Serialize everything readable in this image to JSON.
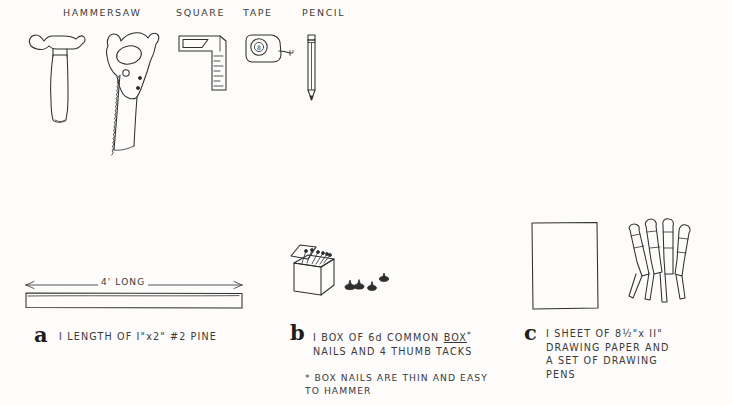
{
  "tools_row": {
    "labels": [
      {
        "name": "hammer",
        "text": "HAMMER"
      },
      {
        "name": "saw",
        "text": "SAW"
      },
      {
        "name": "square",
        "text": "SQUARE"
      },
      {
        "name": "tape",
        "text": "TAPE"
      },
      {
        "name": "pencil",
        "text": "PENCIL"
      }
    ],
    "tape_reel_mark": "8"
  },
  "materials": {
    "a": {
      "letter": "a",
      "dimension": "4' LONG",
      "caption_line1": "I LENGTH OF I\"x2\"  #2 PINE",
      "caption_prefix": "I LENGTH OF I\"x2\" ",
      "caption_grade": "#2 PINE"
    },
    "b": {
      "letter": "b",
      "caption_line1_pre": "I BOX OF 6d COMMON ",
      "caption_line1_underlined": "BOX",
      "caption_line1_star": "*",
      "caption_line2": "NAILS AND 4 THUMB TACKS"
    },
    "c": {
      "letter": "c",
      "caption_line1": "I SHEET OF 8½\"x II\"",
      "caption_line2": "DRAWING PAPER AND",
      "caption_line3": "A  SET OF DRAWING",
      "caption_line4": "PENS"
    }
  },
  "footnote": {
    "line1": "* BOX NAILS ARE THIN AND EASY",
    "line2": "TO HAMMER"
  },
  "colors": {
    "background": "#fdfcfb",
    "ink": "#2f2f2f",
    "text": "#3a3a3a"
  }
}
